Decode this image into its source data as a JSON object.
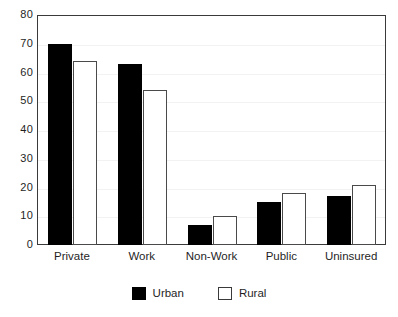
{
  "chart_data": {
    "type": "bar",
    "title": "",
    "subtitle": "",
    "xlabel": "",
    "ylabel": "",
    "categories": [
      "Private",
      "Work",
      "Non-Work",
      "Public",
      "Uninsured"
    ],
    "series": [
      {
        "name": "Urban",
        "values": [
          70,
          63,
          7,
          15,
          17
        ],
        "swatch": "filled",
        "color": "#000000"
      },
      {
        "name": "Rural",
        "values": [
          64,
          54,
          10,
          18,
          21
        ],
        "swatch": "hollow",
        "color": "#ffffff"
      }
    ],
    "ylim": [
      0,
      80
    ],
    "ytick_step": 10,
    "yticks": [
      80,
      70,
      60,
      50,
      40,
      30,
      20,
      10,
      0
    ],
    "ytick_labels": [
      "80",
      "70",
      "60",
      "50",
      "40",
      "30",
      "20",
      "10",
      "0"
    ],
    "grid": true,
    "grid_color": "#f2f2f2",
    "legend_position": "bottom-center",
    "frame_color": "#3a3a3a",
    "background": "#ffffff"
  }
}
